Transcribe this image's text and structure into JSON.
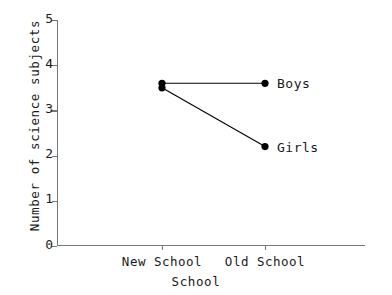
{
  "chart_data": {
    "type": "line",
    "title": "",
    "subtitle": "",
    "xlabel": "School",
    "ylabel": "Number of science subjects",
    "categories": [
      "New School",
      "Old School"
    ],
    "series": [
      {
        "name": "Boys",
        "values": [
          3.6,
          3.6
        ],
        "color": "#000000"
      },
      {
        "name": "Girls",
        "values": [
          3.5,
          2.2
        ],
        "color": "#000000"
      }
    ],
    "ylim": [
      0,
      5
    ],
    "yticks": [
      0,
      1,
      2,
      3,
      4,
      5
    ],
    "ytick_labels": [
      "0",
      "1",
      "2",
      "3",
      "4",
      "5"
    ],
    "xtick_labels": [
      "New School",
      "Old School"
    ],
    "grid": false,
    "legend_position": "inline-right-of-last-point",
    "annotations": [
      {
        "text": "Boys",
        "attached_to": "Boys",
        "at_category": "Old School"
      },
      {
        "text": "Girls",
        "attached_to": "Girls",
        "at_category": "Old School"
      }
    ],
    "marker": "filled-circle",
    "axis_color": "#777777",
    "line_color": "#000000",
    "background": "#ffffff"
  }
}
